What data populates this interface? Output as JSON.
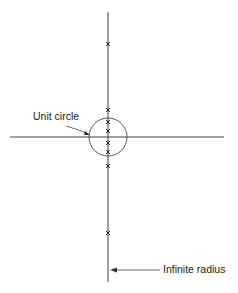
{
  "diagram": {
    "type": "root-locus-plane",
    "labels": {
      "unit_circle": "Unit circle",
      "infinite_radius": "Infinite radius"
    },
    "axes": {
      "horizontal": {
        "x1": 10,
        "x2": 224,
        "y": 137
      },
      "vertical": {
        "x": 108,
        "y1": 12,
        "y2": 282
      }
    },
    "unit_circle": {
      "cx": 108,
      "cy": 137,
      "r": 19
    },
    "pole_marks_y": [
      44,
      110,
      122,
      131,
      143,
      152,
      166,
      233
    ],
    "colors": {
      "line": "#333333",
      "text": "#222222"
    }
  }
}
